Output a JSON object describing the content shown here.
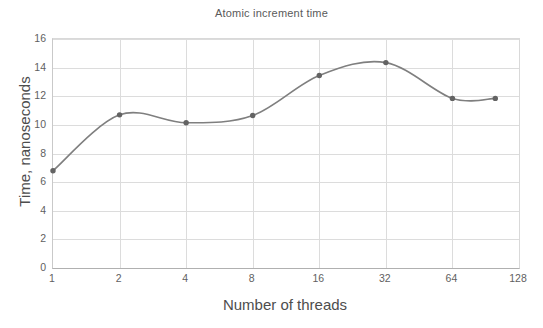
{
  "chart_data": {
    "type": "line",
    "title": "Atomic increment time",
    "xlabel": "Number of threads",
    "ylabel": "Time, nanoseconds",
    "x": [
      1,
      2,
      4,
      8,
      16,
      32,
      64,
      100
    ],
    "values": [
      6.8,
      10.7,
      10.15,
      10.65,
      13.45,
      14.35,
      11.85,
      11.85
    ],
    "series": [
      {
        "name": "Atomic increment time",
        "values": [
          6.8,
          10.7,
          10.15,
          10.65,
          13.45,
          14.35,
          11.85,
          11.85
        ]
      }
    ],
    "x_tick_labels": [
      "1",
      "2",
      "4",
      "8",
      "16",
      "32",
      "64",
      "128"
    ],
    "x_tick_values": [
      1,
      2,
      4,
      8,
      16,
      32,
      64,
      128
    ],
    "x_scale": "log2",
    "xlim": [
      1,
      128
    ],
    "y_tick_labels": [
      "0",
      "2",
      "4",
      "6",
      "8",
      "10",
      "12",
      "14",
      "16"
    ],
    "y_tick_values": [
      0,
      2,
      4,
      6,
      8,
      10,
      12,
      14,
      16
    ],
    "ylim": [
      0,
      16
    ],
    "grid": true,
    "legend": false,
    "smoothing": true,
    "colors": {
      "line": "#7f7f7f",
      "marker": "#636363",
      "gridline": "#dcdcdc",
      "axis": "#b0b0b0",
      "text": "#5f5f5f",
      "title": "#5a5a5a",
      "background": "#ffffff"
    }
  }
}
